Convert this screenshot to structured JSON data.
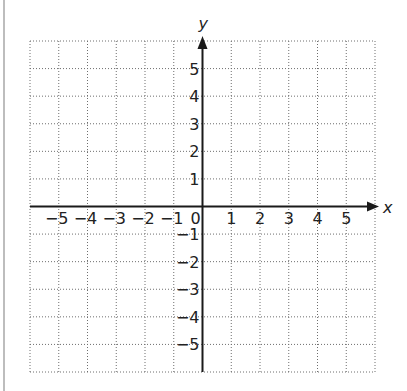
{
  "chart_data": {
    "type": "scatter",
    "title": "",
    "xlabel": "x",
    "ylabel": "y",
    "xlim": [
      -6,
      6
    ],
    "ylim": [
      -6,
      6
    ],
    "grid": true,
    "grid_style": "dotted",
    "x_ticks": [
      -5,
      -4,
      -3,
      -2,
      -1,
      0,
      1,
      2,
      3,
      4,
      5
    ],
    "y_ticks": [
      -5,
      -4,
      -3,
      -2,
      -1,
      1,
      2,
      3,
      4,
      5
    ],
    "x_tick_labels": [
      "−5",
      "−4",
      "−3",
      "−2",
      "−1",
      "0",
      "1",
      "2",
      "3",
      "4",
      "5"
    ],
    "y_tick_labels": [
      "5",
      "4",
      "3",
      "2",
      "1",
      "−1",
      "−2",
      "−3",
      "−4",
      "−5"
    ],
    "series": [],
    "legend": null
  },
  "colors": {
    "axis": "#1a1a1a",
    "grid": "#6e6e6e",
    "border": "#bdbdbd",
    "text": "#222222"
  }
}
